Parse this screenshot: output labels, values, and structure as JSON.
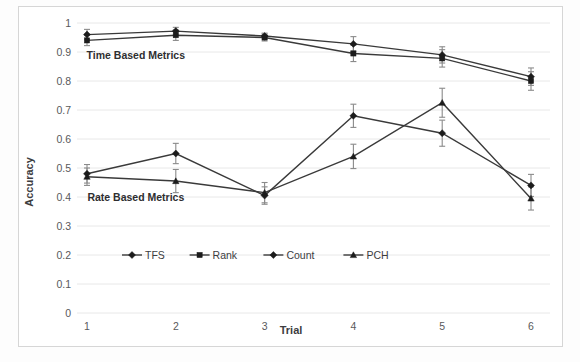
{
  "figure": {
    "background_color": "#fdfdfd",
    "frame_border_color": "#d6d6d6",
    "annotations": [
      {
        "text": "Time Based Metrics",
        "x_trial": 1.55,
        "y_value": 0.875
      },
      {
        "text": "Rate Based Metrics",
        "x_trial": 1.55,
        "y_value": 0.385
      }
    ]
  },
  "chart_data": {
    "type": "line",
    "title": "",
    "xlabel": "Trial",
    "ylabel": "Accuracy",
    "categories": [
      "1",
      "2",
      "3",
      "4",
      "5",
      "6"
    ],
    "x": [
      1,
      2,
      3,
      4,
      5,
      6
    ],
    "ylim": [
      0,
      1
    ],
    "ytick_labels": [
      "0",
      "0.1",
      "0.2",
      "0.3",
      "0.4",
      "0.5",
      "0.6",
      "0.7",
      "0.8",
      "0.9",
      "1"
    ],
    "ytick_values": [
      0,
      0.1,
      0.2,
      0.3,
      0.4,
      0.5,
      0.6,
      0.7,
      0.8,
      0.9,
      1
    ],
    "xtick_labels": [
      "1",
      "2",
      "3",
      "4",
      "5",
      "6"
    ],
    "grid": "horizontal",
    "legend_position": "inside-lower-left",
    "line_color": "#3a3a3a",
    "errorbar_color": "#8a8a8a",
    "series": [
      {
        "name": "TFS",
        "marker": "diamond",
        "group": "Time Based Metrics",
        "values": [
          0.96,
          0.972,
          0.955,
          0.928,
          0.89,
          0.815
        ],
        "errors": [
          0.018,
          0.013,
          0.01,
          0.025,
          0.028,
          0.03
        ]
      },
      {
        "name": "Rank",
        "marker": "square",
        "group": "Time Based Metrics",
        "values": [
          0.94,
          0.958,
          0.95,
          0.895,
          0.878,
          0.8
        ],
        "errors": [
          0.018,
          0.018,
          0.012,
          0.028,
          0.03,
          0.032
        ]
      },
      {
        "name": "Count",
        "marker": "diamond",
        "group": "Rate Based Metrics",
        "values": [
          0.48,
          0.55,
          0.405,
          0.68,
          0.62,
          0.44
        ],
        "errors": [
          0.032,
          0.035,
          0.03,
          0.04,
          0.045,
          0.038
        ]
      },
      {
        "name": "PCH",
        "marker": "triangle",
        "group": "Rate Based Metrics",
        "values": [
          0.47,
          0.455,
          0.415,
          0.54,
          0.725,
          0.395
        ]
      }
    ],
    "series_pch_errors": [
      0.03,
      0.04,
      0.035,
      0.042,
      0.05,
      0.04
    ]
  },
  "legend": {
    "entries": [
      {
        "label": "TFS",
        "marker": "diamond"
      },
      {
        "label": "Rank",
        "marker": "square"
      },
      {
        "label": "Count",
        "marker": "diamond"
      },
      {
        "label": "PCH",
        "marker": "triangle"
      }
    ]
  }
}
